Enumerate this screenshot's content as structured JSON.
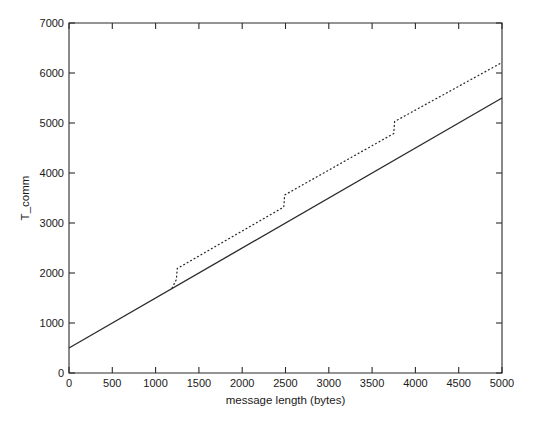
{
  "chart_data": {
    "type": "line",
    "title": "",
    "xlabel": "message length (bytes)",
    "ylabel": "T_comm",
    "xlim": [
      0,
      5000
    ],
    "ylim": [
      0,
      7000
    ],
    "xticks": [
      0,
      500,
      1000,
      1500,
      2000,
      2500,
      3000,
      3500,
      4000,
      4500,
      5000
    ],
    "xticklabels": [
      "0",
      "500",
      "1000",
      "1500",
      "2000",
      "2500",
      "3000",
      "3500",
      "4000",
      "4500",
      "5000"
    ],
    "yticks": [
      0,
      1000,
      2000,
      3000,
      4000,
      5000,
      6000,
      7000
    ],
    "yticklabels": [
      "0",
      "1000",
      "2000",
      "3000",
      "4000",
      "5000",
      "6000",
      "7000"
    ],
    "grid": false,
    "legend": "none",
    "box": true,
    "series": [
      {
        "name": "solid-line",
        "style": "solid",
        "color": "#2b2b2b",
        "x": [
          0,
          5000
        ],
        "y": [
          500,
          5500
        ]
      },
      {
        "name": "dotted-step-line",
        "style": "dotted",
        "color": "#2b2b2b",
        "x": [
          1190,
          1240,
          1250,
          2480,
          2490,
          3750,
          3760,
          5000
        ],
        "y": [
          1700,
          1870,
          2090,
          3320,
          3560,
          4790,
          5030,
          6210
        ]
      }
    ]
  },
  "axes": {
    "x_title": "message length (bytes)",
    "y_title": "T_comm"
  }
}
